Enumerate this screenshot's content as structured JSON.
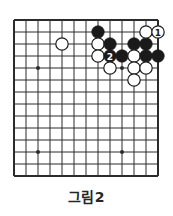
{
  "figure": {
    "caption": "그림2",
    "kind": "go-board-diagram"
  },
  "board": {
    "origin_x": 14,
    "origin_y": 20,
    "spacing": 12,
    "columns": 13,
    "rows": 14,
    "line_color": "#2b2b2b",
    "edge_line_width": 2.0,
    "inner_line_width": 1.0,
    "background": "#ffffff",
    "stone_radius": 6.2,
    "black_color": "#1a1a1a",
    "white_color": "#ffffff",
    "white_outline": "#1a1a1a",
    "label_on_black_color": "#ffffff",
    "label_on_white_color": "#1a1a1a",
    "star_point_radius": 2.0,
    "star_points": [
      {
        "col": 2,
        "row": 4
      },
      {
        "col": 9,
        "row": 4
      },
      {
        "col": 2,
        "row": 11
      },
      {
        "col": 9,
        "row": 11
      }
    ]
  },
  "stones": [
    {
      "id": "b-c7r1",
      "color": "black",
      "col": 7,
      "row": 1,
      "label": ""
    },
    {
      "id": "w-c4r2",
      "color": "white",
      "col": 4,
      "row": 2,
      "label": ""
    },
    {
      "id": "w-c7r2",
      "color": "white",
      "col": 7,
      "row": 2,
      "label": ""
    },
    {
      "id": "b-c8r2",
      "color": "black",
      "col": 8,
      "row": 2,
      "label": ""
    },
    {
      "id": "b-c10r2",
      "color": "black",
      "col": 10,
      "row": 2,
      "label": ""
    },
    {
      "id": "b-c11r2",
      "color": "black",
      "col": 11,
      "row": 2,
      "label": ""
    },
    {
      "id": "w-c11r1",
      "color": "white",
      "col": 11,
      "row": 1,
      "label": ""
    },
    {
      "id": "w-c12r1",
      "color": "white",
      "col": 12,
      "row": 1,
      "label": "1"
    },
    {
      "id": "w-c7r3",
      "color": "white",
      "col": 7,
      "row": 3,
      "label": ""
    },
    {
      "id": "b-c8r3",
      "color": "black",
      "col": 8,
      "row": 3,
      "label": "2"
    },
    {
      "id": "b-c9r3",
      "color": "black",
      "col": 9,
      "row": 3,
      "label": ""
    },
    {
      "id": "w-c10r3",
      "color": "white",
      "col": 10,
      "row": 3,
      "label": ""
    },
    {
      "id": "b-c11r3",
      "color": "black",
      "col": 11,
      "row": 3,
      "label": ""
    },
    {
      "id": "b-c12r3",
      "color": "black",
      "col": 12,
      "row": 3,
      "label": ""
    },
    {
      "id": "w-c8r4",
      "color": "white",
      "col": 8,
      "row": 4,
      "label": ""
    },
    {
      "id": "w-c10r4",
      "color": "white",
      "col": 10,
      "row": 4,
      "label": ""
    },
    {
      "id": "w-c11r4",
      "color": "white",
      "col": 11,
      "row": 4,
      "label": ""
    },
    {
      "id": "w-c10r5",
      "color": "white",
      "col": 10,
      "row": 5,
      "label": ""
    }
  ],
  "move_labels": [
    {
      "number": "1",
      "stone_id": "w-c12r1",
      "color": "white"
    },
    {
      "number": "2",
      "stone_id": "b-c8r3",
      "color": "black"
    }
  ]
}
